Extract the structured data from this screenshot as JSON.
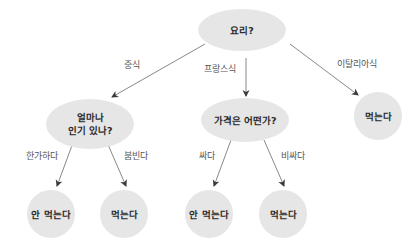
{
  "diagram": {
    "type": "decision-tree",
    "colors": {
      "background": "#ffffff",
      "node_fill": "#e6e6e6",
      "node_text": "#2a2a2a",
      "edge": "#6a6a6a",
      "edge_label": "#555555"
    },
    "nodes": [
      {
        "id": "root",
        "label": "요리?",
        "shape": "ellipse",
        "cx": 242,
        "cy": 30,
        "rx": 44,
        "ry": 21
      },
      {
        "id": "popularity",
        "label_lines": [
          "얼마나",
          "인기 있나?"
        ],
        "shape": "ellipse",
        "cx": 90,
        "cy": 124,
        "rx": 44,
        "ry": 25
      },
      {
        "id": "price",
        "label": "가격은 어떤가?",
        "shape": "ellipse",
        "cx": 245,
        "cy": 120,
        "rx": 44,
        "ry": 22
      },
      {
        "id": "italian-eat",
        "label": "먹는다",
        "shape": "circle",
        "cx": 378,
        "cy": 116,
        "r": 24
      },
      {
        "id": "quiet-noeat",
        "label": "안 먹는다",
        "shape": "circle",
        "cx": 51,
        "cy": 214,
        "r": 24
      },
      {
        "id": "busy-eat",
        "label": "먹는다",
        "shape": "circle",
        "cx": 124,
        "cy": 214,
        "r": 24
      },
      {
        "id": "cheap-noeat",
        "label": "안 먹는다",
        "shape": "circle",
        "cx": 209,
        "cy": 214,
        "r": 24
      },
      {
        "id": "expensive-eat",
        "label": "먹는다",
        "shape": "circle",
        "cx": 283,
        "cy": 214,
        "r": 24
      }
    ],
    "edges": [
      {
        "from": "root",
        "to": "popularity",
        "label": "중식",
        "x1": 205,
        "y1": 44,
        "x2": 112,
        "y2": 97,
        "lx": 132,
        "ly": 65
      },
      {
        "from": "root",
        "to": "price",
        "label": "프랑스식",
        "x1": 246,
        "y1": 58,
        "x2": 246,
        "y2": 96,
        "lx": 220,
        "ly": 69
      },
      {
        "from": "root",
        "to": "italian-eat",
        "label": "이탈리아식",
        "x1": 290,
        "y1": 44,
        "x2": 358,
        "y2": 95,
        "lx": 357,
        "ly": 64
      },
      {
        "from": "popularity",
        "to": "quiet-noeat",
        "label": "한가하다",
        "x1": 74,
        "y1": 140,
        "x2": 57,
        "y2": 186,
        "lx": 42,
        "ly": 156
      },
      {
        "from": "popularity",
        "to": "busy-eat",
        "label": "붐빈다",
        "x1": 106,
        "y1": 140,
        "x2": 126,
        "y2": 186,
        "lx": 136,
        "ly": 156
      },
      {
        "from": "price",
        "to": "cheap-noeat",
        "label": "싸다",
        "x1": 231,
        "y1": 140,
        "x2": 214,
        "y2": 186,
        "lx": 207,
        "ly": 156
      },
      {
        "from": "price",
        "to": "expensive-eat",
        "label": "비싸다",
        "x1": 264,
        "y1": 140,
        "x2": 284,
        "y2": 186,
        "lx": 293,
        "ly": 156
      }
    ]
  }
}
